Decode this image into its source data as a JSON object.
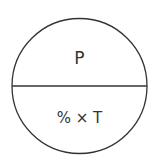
{
  "diagram": {
    "type": "formula-triangle-circle",
    "top_label": "P",
    "bottom_label": "% × T",
    "stroke_color": "#333333",
    "background": "#ffffff"
  }
}
